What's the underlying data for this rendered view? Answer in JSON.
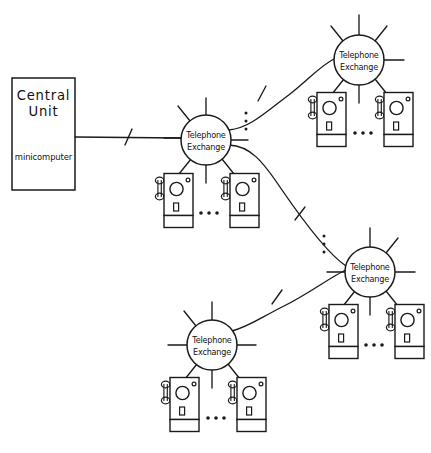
{
  "diagram": {
    "background_color": "#ffffff",
    "line_color": "#1a1a1a",
    "width": 431,
    "height": 453
  },
  "central_unit": {
    "title_line1": "Central",
    "title_line2": "Unit",
    "subtitle": "minicomputer",
    "x": 12,
    "y": 78,
    "width": 63,
    "height": 112
  },
  "exchanges": [
    {
      "id": "exchange-center",
      "label_line1": "Telephone",
      "label_line2": "Exchange",
      "cx": 206,
      "cy": 140,
      "r": 25,
      "spokes": [
        95,
        140,
        185,
        230,
        275,
        320
      ],
      "phones": [
        {
          "x": 155,
          "y": 172
        },
        {
          "x": 221,
          "y": 172
        }
      ],
      "ellipsis": {
        "x": 208,
        "y": 213,
        "orientation": "horizontal"
      }
    },
    {
      "id": "exchange-top-right",
      "label_line1": "Telephone",
      "label_line2": "Exchange",
      "cx": 359,
      "cy": 60,
      "r": 25,
      "spokes": [
        0,
        45,
        90,
        135,
        225,
        270,
        315
      ],
      "phones": [
        {
          "x": 308,
          "y": 91
        },
        {
          "x": 375,
          "y": 91
        }
      ],
      "ellipsis": {
        "x": 361,
        "y": 133,
        "orientation": "horizontal"
      }
    },
    {
      "id": "exchange-mid-right",
      "label_line1": "Telephone",
      "label_line2": "Exchange",
      "cx": 370,
      "cy": 272,
      "r": 25,
      "spokes": [
        0,
        45,
        90,
        180,
        225,
        270,
        315
      ],
      "phones": [
        {
          "x": 320,
          "y": 303
        },
        {
          "x": 386,
          "y": 303
        }
      ],
      "ellipsis": {
        "x": 372,
        "y": 345,
        "orientation": "horizontal"
      }
    },
    {
      "id": "exchange-bottom",
      "label_line1": "Telephone",
      "label_line2": "Exchange",
      "cx": 212,
      "cy": 345,
      "r": 25,
      "spokes": [
        0,
        45,
        90,
        135,
        180,
        225,
        270,
        315
      ],
      "phones": [
        {
          "x": 161,
          "y": 376
        },
        {
          "x": 228,
          "y": 376
        }
      ],
      "ellipsis": {
        "x": 214,
        "y": 418,
        "orientation": "horizontal"
      }
    }
  ],
  "trunk_links": [
    {
      "id": "link-central-unit-to-exchange-center",
      "from": "central-unit",
      "to": "exchange-center",
      "x1": 75,
      "y1": 137,
      "x2": 181,
      "y2": 138,
      "tick": true
    },
    {
      "id": "link-exchange-center-to-top-right",
      "from": "exchange-center",
      "to": "exchange-top-right",
      "x1": 229,
      "y1": 130,
      "x2": 334,
      "y2": 58,
      "tick": true
    },
    {
      "id": "link-exchange-center-to-mid-right",
      "from": "exchange-center",
      "to": "exchange-mid-right",
      "x1": 229,
      "y1": 145,
      "x2": 346,
      "y2": 265,
      "tick": true
    },
    {
      "id": "link-exchange-bottom-to-mid-right",
      "from": "exchange-bottom",
      "to": "exchange-mid-right",
      "x1": 232,
      "y1": 330,
      "x2": 346,
      "y2": 270,
      "tick": true
    }
  ],
  "vertical_ellipses": [
    {
      "id": "ellipsis-center-branches",
      "x": 246,
      "y": 120
    },
    {
      "id": "ellipsis-midright-branches",
      "x": 324,
      "y": 243
    }
  ],
  "phone_icon": {
    "semantic_name": "telephone-icon",
    "body_width": 29,
    "body_height": 42,
    "base_height": 12,
    "dial_radius": 6.6,
    "led_radius": 1.9
  }
}
